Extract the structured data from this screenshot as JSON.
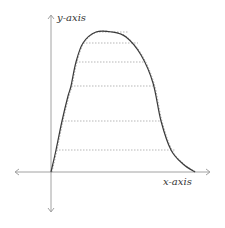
{
  "diagram": {
    "type": "function-plot",
    "labels": {
      "y_axis": "y-axis",
      "x_axis": "x-axis"
    },
    "colors": {
      "axis": "#8a8a8a",
      "curve": "#3a3a3a",
      "dashed": "#9a9a9a",
      "label": "#333333"
    },
    "origin": [
      51,
      172
    ],
    "curve_points": [
      [
        51,
        172
      ],
      [
        56,
        150
      ],
      [
        62,
        121
      ],
      [
        68,
        96
      ],
      [
        71,
        86
      ],
      [
        76,
        62
      ],
      [
        83,
        43
      ],
      [
        96,
        32
      ],
      [
        112,
        32
      ],
      [
        126,
        37
      ],
      [
        141,
        55
      ],
      [
        153,
        83
      ],
      [
        161,
        121
      ],
      [
        171,
        150
      ],
      [
        183,
        164
      ],
      [
        195,
        172
      ]
    ],
    "dashed_levels": [
      {
        "y": 32,
        "x_start": 96,
        "x_end": 128
      },
      {
        "y": 43,
        "x_start": 83,
        "x_end": 138
      },
      {
        "y": 62,
        "x_start": 76,
        "x_end": 145
      },
      {
        "y": 86,
        "x_start": 71,
        "x_end": 153
      },
      {
        "y": 121,
        "x_start": 62,
        "x_end": 161
      },
      {
        "y": 150,
        "x_start": 56,
        "x_end": 175
      }
    ]
  }
}
